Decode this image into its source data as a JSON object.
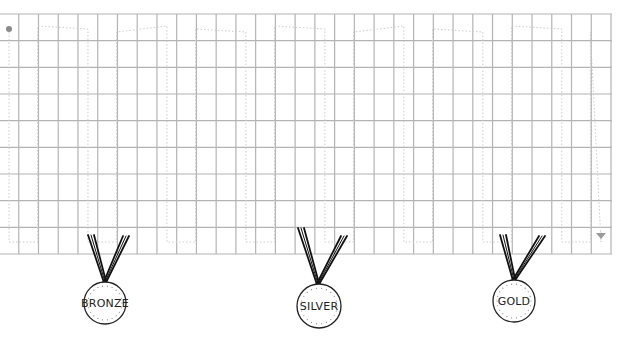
{
  "board": {
    "left": 0,
    "top": 14,
    "right": 612,
    "bottom": 254,
    "columns": 31,
    "rows": 9,
    "col_width": 19.74,
    "grid_color": "#b4b4b4",
    "path_color": "#cccccc",
    "start_marker_color": "#8a8a8a",
    "end_marker_color": "#9a9a9a",
    "start_marker": {
      "x": 9,
      "y": 29
    },
    "end_marker": {
      "x": 601,
      "y": 236
    }
  },
  "medals": [
    {
      "label": "BRONZE",
      "circle": {
        "cx": 105,
        "cy": 303,
        "r": 21
      },
      "ribbon": {
        "lx": 91,
        "ly": 235,
        "rx": 126,
        "ry": 236,
        "bx": 105,
        "by": 282
      }
    },
    {
      "label": "SILVER",
      "circle": {
        "cx": 319,
        "cy": 306,
        "r": 22
      },
      "ribbon": {
        "lx": 301,
        "ly": 228,
        "rx": 344,
        "ry": 236,
        "bx": 318,
        "by": 284
      }
    },
    {
      "label": "GOLD",
      "circle": {
        "cx": 514,
        "cy": 301,
        "r": 21
      },
      "ribbon": {
        "lx": 503,
        "ly": 235,
        "rx": 542,
        "ry": 236,
        "bx": 514,
        "by": 280
      }
    }
  ]
}
